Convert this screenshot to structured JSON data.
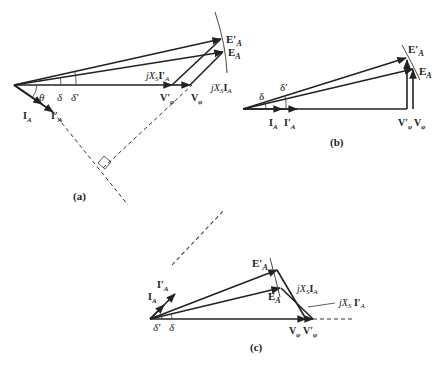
{
  "figure": {
    "panels": [
      {
        "id": "a",
        "caption": "(a)",
        "labels": {
          "E_prime": "E′",
          "E": "E",
          "jXsIa_prime": "jXS I′",
          "jXsIa": "jXS I",
          "V_prime": "V′",
          "V": "V",
          "theta": "θ",
          "delta": "δ",
          "delta_prime": "δ′",
          "Ia": "I",
          "Ia_prime": "I′"
        }
      },
      {
        "id": "b",
        "caption": "(b)",
        "labels": {
          "E_prime": "E′",
          "E": "E",
          "V_prime": "V′",
          "V": "V",
          "delta": "δ",
          "delta_prime": "δ′",
          "Ia": "I",
          "Ia_prime": "I′"
        }
      },
      {
        "id": "c",
        "caption": "(c)",
        "labels": {
          "E_prime": "E′",
          "E": "E",
          "jXsIa": "jXS I",
          "jXsIa_prime": "jXS I′",
          "V": "V",
          "V_prime": "V′",
          "delta": "δ",
          "delta_prime": "δ′",
          "Ia": "I",
          "Ia_prime": "I′"
        }
      }
    ],
    "subscripts": {
      "A": "A",
      "phi": "φ",
      "S": "S"
    }
  }
}
